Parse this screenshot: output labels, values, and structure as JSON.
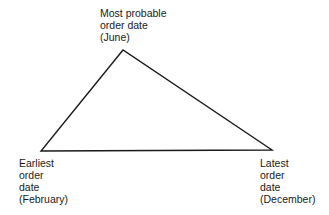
{
  "diagram": {
    "type": "triangle-distribution",
    "vertices": {
      "apex": {
        "x": 123,
        "y": 50,
        "lines": [
          "Most probable",
          "order date",
          "(June)"
        ]
      },
      "left": {
        "x": 41,
        "y": 151,
        "lines": [
          "Earliest",
          "order",
          "date",
          "(February)"
        ]
      },
      "right": {
        "x": 272,
        "y": 150,
        "lines": [
          "Latest",
          "order",
          "date",
          "(December)"
        ]
      }
    },
    "stroke_color": "#1a1a1a"
  }
}
